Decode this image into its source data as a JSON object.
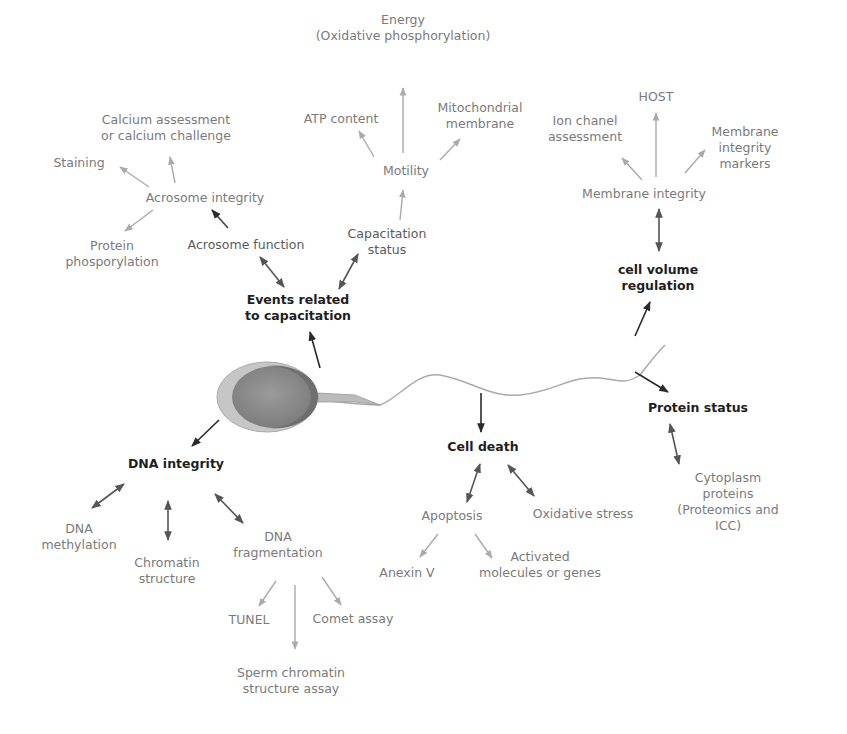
{
  "diagram": {
    "type": "mind-map",
    "center": "sperm cell illustration",
    "colors": {
      "main_text": "#1e1e1e",
      "sub_text": "#5a5a5a",
      "leaf_text": "#7a7a7a",
      "dark_arrow": "#2a2a2a",
      "mid_arrow": "#555555",
      "light_arrow": "#aaaaaa"
    },
    "nodes": {
      "energy": "Energy\n(Oxidative phosphorylation)",
      "atp": "ATP content",
      "mito": "Mitochondrial\nmembrane",
      "motility": "Motility",
      "capstatus": "Capacitation\nstatus",
      "calcium": "Calcium assessment\nor calcium challenge",
      "staining": "Staining",
      "acr_integrity": "Acrosome integrity",
      "protein_phos": "Protein\nphosporylation",
      "acr_function": "Acrosome function",
      "events": "Events related\nto capacitation",
      "host": "HOST",
      "ion": "Ion chanel\nassessment",
      "mem_markers": "Membrane integrity\nmarkers",
      "mem_integrity": "Membrane integrity",
      "cellvol": "cell volume\nregulation",
      "protein_status": "Protein status",
      "cyto": "Cytoplasm proteins\n(Proteomics and ICC)",
      "cell_death": "Cell death",
      "apoptosis": "Apoptosis",
      "oxstress": "Oxidative stress",
      "anexin": "Anexin V",
      "activated": "Activated\nmolecules or genes",
      "dna_integrity": "DNA integrity",
      "dna_meth": "DNA\nmethylation",
      "chromatin": "Chromatin\nstructure",
      "dna_frag": "DNA\nfragmentation",
      "tunel": "TUNEL",
      "comet": "Comet assay",
      "scsa": "Sperm chromatin\nstructure assay"
    }
  }
}
